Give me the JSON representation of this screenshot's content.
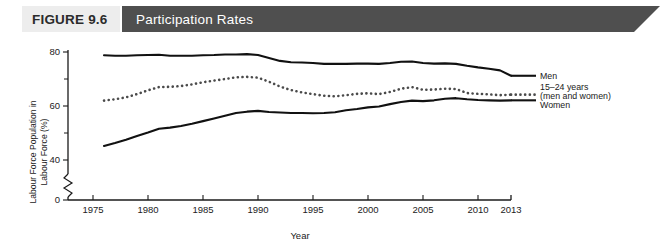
{
  "banner": {
    "figure_label": "FIGURE 9.6",
    "title": "Participation Rates",
    "figure_bg": "#ededed",
    "title_bg": "#4f4f4f",
    "title_color": "#ffffff"
  },
  "chart_data": {
    "type": "line",
    "title": "Participation Rates",
    "xlabel": "Year",
    "ylabel": "Labour Force Population in Labour Force (%)",
    "xlim": [
      1975,
      2013
    ],
    "ylim": [
      38,
      84
    ],
    "axis_break": true,
    "axis_break_between": [
      0,
      40
    ],
    "grid": false,
    "legend_position": "right",
    "y_ticks": [
      0,
      40,
      60,
      80
    ],
    "y_minor_ticks": [
      50,
      70
    ],
    "y_tick_labels": [
      "0",
      "40",
      "60",
      "80"
    ],
    "x_ticks": [
      1975,
      1980,
      1985,
      1990,
      1995,
      2000,
      2005,
      2010,
      2013
    ],
    "x_tick_labels": [
      "1975",
      "1980",
      "1985",
      "1990",
      "1995",
      "2000",
      "2005",
      "2010",
      "2013"
    ],
    "x": [
      1976,
      1977,
      1978,
      1979,
      1980,
      1981,
      1982,
      1983,
      1984,
      1985,
      1986,
      1987,
      1988,
      1989,
      1990,
      1991,
      1992,
      1993,
      1994,
      1995,
      1996,
      1997,
      1998,
      1999,
      2000,
      2001,
      2002,
      2003,
      2004,
      2005,
      2006,
      2007,
      2008,
      2009,
      2010,
      2011,
      2012,
      2013
    ],
    "series": [
      {
        "name": "Men",
        "style": "solid",
        "color": "#111111",
        "values": [
          78.8,
          78.6,
          78.6,
          78.8,
          78.9,
          79.0,
          78.6,
          78.6,
          78.6,
          78.8,
          78.9,
          79.1,
          79.1,
          79.2,
          78.9,
          77.8,
          76.7,
          76.2,
          76.1,
          75.9,
          75.6,
          75.6,
          75.6,
          75.7,
          75.7,
          75.6,
          75.9,
          76.4,
          76.5,
          75.9,
          75.7,
          75.8,
          75.6,
          74.9,
          74.3,
          73.8,
          73.2,
          71.2
        ]
      },
      {
        "name": "15–24 years (men and women)",
        "style": "dotted",
        "color": "#4a4a4a",
        "values": [
          62.0,
          62.5,
          63.2,
          64.4,
          65.8,
          67.0,
          67.1,
          67.4,
          68.0,
          68.8,
          69.4,
          70.0,
          70.6,
          70.8,
          70.5,
          69.0,
          67.2,
          65.9,
          65.0,
          64.4,
          63.8,
          63.6,
          64.0,
          64.5,
          64.7,
          64.4,
          65.2,
          66.4,
          67.0,
          66.0,
          66.1,
          66.4,
          66.3,
          64.8,
          64.5,
          64.3,
          64.0,
          64.2
        ]
      },
      {
        "name": "Women",
        "style": "solid",
        "color": "#111111",
        "values": [
          45.2,
          46.3,
          47.5,
          48.9,
          50.2,
          51.6,
          52.0,
          52.6,
          53.4,
          54.4,
          55.4,
          56.4,
          57.4,
          57.9,
          58.2,
          57.8,
          57.6,
          57.4,
          57.4,
          57.3,
          57.4,
          57.7,
          58.4,
          58.9,
          59.5,
          59.8,
          60.7,
          61.5,
          62.0,
          61.8,
          62.1,
          62.7,
          62.9,
          62.5,
          62.2,
          62.1,
          62.0,
          62.1
        ]
      }
    ]
  },
  "legend": [
    {
      "label": "Men",
      "style": "solid"
    },
    {
      "label": "15–24 years",
      "style": "dotted"
    },
    {
      "label": "(men and women)",
      "style": "none"
    },
    {
      "label": "Women",
      "style": "solid"
    }
  ]
}
